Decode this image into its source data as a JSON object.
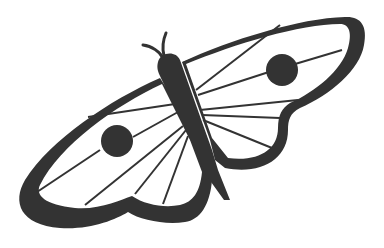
{
  "illustration": {
    "subject": "moth",
    "style": "black line art silhouette on white",
    "colors": {
      "ink": "#333333",
      "background": "#ffffff"
    },
    "parts": [
      "antennae",
      "body",
      "left-wing",
      "right-wing",
      "left-eyespot",
      "right-eyespot",
      "wing-veins"
    ]
  }
}
